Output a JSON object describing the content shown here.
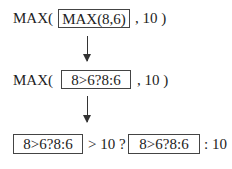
{
  "row1": {
    "prefix": "MAX(",
    "box": "MAX(8,6)",
    "suffix": ", 10 )"
  },
  "row2": {
    "prefix": "MAX(",
    "box": "8>6?8:6",
    "suffix": ", 10 )"
  },
  "row3": {
    "box1": "8>6?8:6",
    "mid": "> 10 ?",
    "box2": "8>6?8:6",
    "suffix": ": 10"
  },
  "icons": [
    "arrow-down-icon",
    "arrow-down-icon"
  ]
}
